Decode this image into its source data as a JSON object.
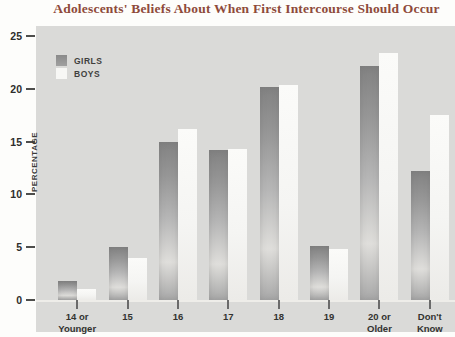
{
  "title": "Adolescents' Beliefs About When First Intercourse Should Occur",
  "colors": {
    "title_text": "#8e4a3a",
    "panel_background": "#dadad8",
    "girls_bar": "#8f8f8f",
    "boys_bar": "#f6f6f4",
    "axis_text": "#333330",
    "tick_mark": "#6a6a6a"
  },
  "chart_data": {
    "type": "bar",
    "categories": [
      "14 or\nYounger",
      "15",
      "16",
      "17",
      "18",
      "19",
      "20 or\nOlder",
      "Don't\nKnow"
    ],
    "series": [
      {
        "name": "GIRLS",
        "values": [
          1.8,
          5.0,
          15.0,
          14.2,
          20.2,
          5.1,
          22.2,
          12.2
        ]
      },
      {
        "name": "BOYS",
        "values": [
          1.0,
          4.0,
          16.2,
          14.3,
          20.4,
          4.8,
          23.4,
          17.5
        ]
      }
    ],
    "title": "Adolescents' Beliefs About When First Intercourse Should Occur",
    "xlabel": "",
    "ylabel": "PERCENTAGE",
    "yticks": [
      0,
      5,
      10,
      15,
      20,
      25
    ],
    "ylim": [
      0,
      25
    ],
    "grid": false,
    "legend_position": "top-left"
  }
}
